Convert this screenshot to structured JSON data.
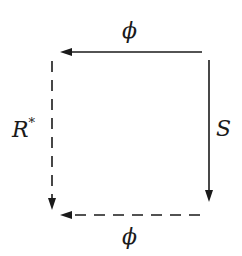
{
  "diagram": {
    "type": "commutative-square",
    "labels": {
      "top": "ϕ",
      "bottom": "ϕ",
      "left_main": "R",
      "left_sup": "*",
      "right": "S"
    },
    "arrows": [
      {
        "id": "top",
        "label": "ϕ",
        "style": "solid",
        "direction": "right-to-left"
      },
      {
        "id": "right",
        "label": "S",
        "style": "solid",
        "direction": "top-to-bottom"
      },
      {
        "id": "left",
        "label": "R*",
        "style": "dashed",
        "direction": "top-to-bottom"
      },
      {
        "id": "bottom",
        "label": "ϕ",
        "style": "dashed",
        "direction": "right-to-left"
      }
    ],
    "colors": {
      "stroke": "#1a1a1a",
      "background": "#ffffff"
    }
  }
}
